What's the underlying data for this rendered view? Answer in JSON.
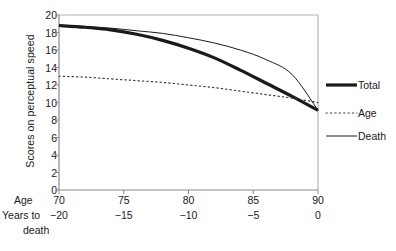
{
  "chart_data": {
    "type": "line",
    "title": "",
    "subtitle": "",
    "ylabel": "Scores on perceptual speed",
    "xlabel": "",
    "ylim": [
      0,
      20
    ],
    "yticks": [
      20,
      18,
      16,
      14,
      12,
      10,
      8,
      6,
      4,
      2,
      0
    ],
    "ytick_labels": [
      "20",
      "18",
      "16",
      "14",
      "12",
      "10",
      "8",
      "6",
      "4",
      "2",
      "0"
    ],
    "x_axis_rows": [
      {
        "name": "Age",
        "label": "Age",
        "ticks": [
          70,
          75,
          80,
          85,
          90
        ],
        "tick_labels": [
          "70",
          "75",
          "80",
          "85",
          "90"
        ],
        "xlim": [
          70,
          90
        ]
      },
      {
        "name": "Years to death",
        "label_line1": "Years to",
        "label_line2": "death",
        "ticks": [
          -20,
          -15,
          -10,
          -5,
          0
        ],
        "tick_labels": [
          "−20",
          "−15",
          "−10",
          "−5",
          "0"
        ],
        "xlim": [
          -20,
          0
        ]
      }
    ],
    "grid": false,
    "legend_position": "right",
    "series": [
      {
        "name": "Total",
        "label": "Total",
        "style": "thick-solid",
        "color": "#1a1a1a",
        "width": 3.2,
        "x": [
          70,
          72,
          74,
          76,
          78,
          80,
          82,
          84,
          86,
          88,
          90
        ],
        "values": [
          18.8,
          18.6,
          18.3,
          17.8,
          17.1,
          16.2,
          15.1,
          13.7,
          12.2,
          10.7,
          9.1
        ]
      },
      {
        "name": "Age",
        "label": "Age",
        "style": "dotted",
        "color": "#3a3a3a",
        "width": 1.2,
        "x": [
          70,
          72,
          74,
          76,
          78,
          80,
          82,
          84,
          86,
          88,
          90
        ],
        "values": [
          13.0,
          12.9,
          12.7,
          12.5,
          12.3,
          12.0,
          11.7,
          11.3,
          10.9,
          10.5,
          10.0
        ]
      },
      {
        "name": "Death",
        "label": "Death",
        "style": "thin-solid",
        "color": "#1a1a1a",
        "width": 1.0,
        "x": [
          70,
          72,
          74,
          76,
          78,
          80,
          82,
          84,
          86,
          88,
          90
        ],
        "values": [
          18.8,
          18.7,
          18.5,
          18.2,
          17.9,
          17.4,
          16.8,
          16.0,
          14.9,
          13.2,
          9.1
        ]
      }
    ],
    "axis_color": "#9a9a9a",
    "text_color": "#1a1a1a"
  },
  "legend": {
    "items": [
      {
        "label": "Total",
        "style": "thick-solid"
      },
      {
        "label": "Age",
        "style": "dotted"
      },
      {
        "label": "Death",
        "style": "thin-solid"
      }
    ]
  },
  "axis_labels": {
    "y": "Scores on perceptual speed",
    "age": "Age",
    "ytd_line1": "Years to",
    "ytd_line2": "death"
  }
}
